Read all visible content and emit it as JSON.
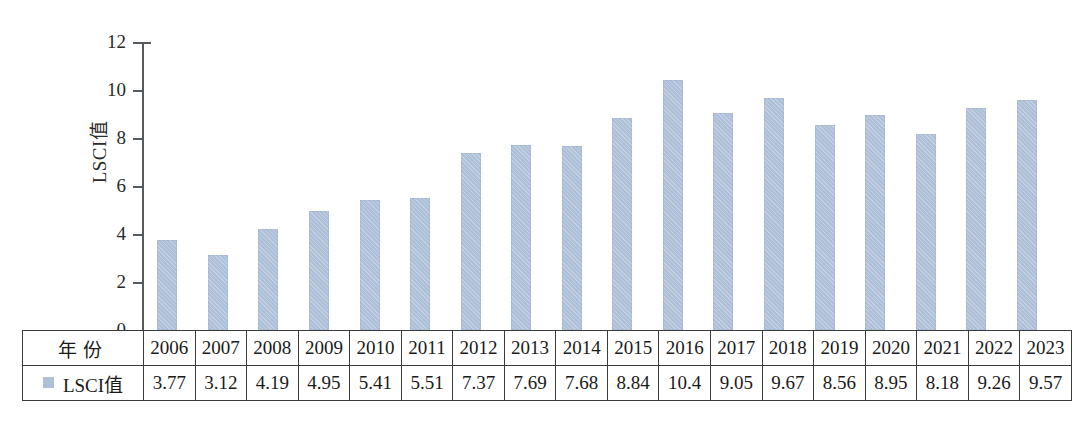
{
  "chart_data": {
    "type": "bar",
    "title": "",
    "xlabel": "",
    "ylabel": "LSCI值",
    "ylim": [
      0,
      12
    ],
    "yticks": [
      "0",
      "2",
      "4",
      "6",
      "8",
      "10",
      "12"
    ],
    "grid": false,
    "legend": [
      "LSCI值"
    ],
    "legend_position": "table-row-header",
    "series_color": "#aebfd8",
    "axis_color": "#555a5e",
    "categories": [
      "2006",
      "2007",
      "2008",
      "2009",
      "2010",
      "2011",
      "2012",
      "2013",
      "2014",
      "2015",
      "2016",
      "2017",
      "2018",
      "2019",
      "2020",
      "2021",
      "2022",
      "2023"
    ],
    "values": [
      3.77,
      3.12,
      4.19,
      4.95,
      5.41,
      5.51,
      7.37,
      7.69,
      7.68,
      8.84,
      10.4,
      9.05,
      9.67,
      8.56,
      8.95,
      8.18,
      9.26,
      9.57
    ],
    "value_labels": [
      "3.77",
      "3.12",
      "4.19",
      "4.95",
      "5.41",
      "5.51",
      "7.37",
      "7.69",
      "7.68",
      "8.84",
      "10.4",
      "9.05",
      "9.67",
      "8.56",
      "8.95",
      "8.18",
      "9.26",
      "9.57"
    ]
  },
  "table": {
    "year_row_label": "年份",
    "value_row_label": "LSCI值"
  }
}
